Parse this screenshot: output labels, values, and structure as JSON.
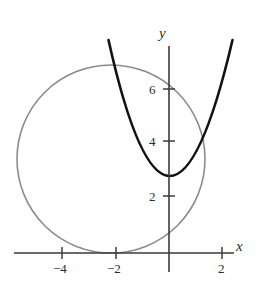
{
  "figure": {
    "title": "",
    "background_color": "#ffffff"
  },
  "axes": {
    "x_axis_label": "x",
    "y_axis_label": "y",
    "axis_color": "#3a3a3a",
    "origin_px": {
      "x": 169,
      "y": 253
    },
    "unit_px": {
      "x": 26.7,
      "y": 26.7
    },
    "x_ticks": [
      {
        "value": -4,
        "label": "−4",
        "px_x": 62
      },
      {
        "value": -2,
        "label": "−2",
        "px_x": 116
      },
      {
        "value": 2,
        "label": "2",
        "px_x": 222
      }
    ],
    "y_ticks": [
      {
        "value": 2,
        "label": "2",
        "px_y": 196
      },
      {
        "value": 4,
        "label": "4",
        "px_y": 141
      },
      {
        "value": 6,
        "label": "6",
        "px_y": 89
      }
    ],
    "x_range": [
      -5.3,
      3.2
    ],
    "y_range": [
      -1.4,
      8.6
    ],
    "grid": false,
    "legend": null
  },
  "chart_data": {
    "type": "line",
    "title": "",
    "xlabel": "x",
    "ylabel": "y",
    "xlim": [
      -5.3,
      3.2
    ],
    "ylim": [
      -1.4,
      8.6
    ],
    "grid": false,
    "legend_position": "none",
    "series": [
      {
        "name": "parabola",
        "kind": "parabola",
        "color": "#111111",
        "line_width": 2.6,
        "equation": "y = 1.25x^2 + 1",
        "vertex": [
          0,
          1
        ],
        "x": [
          -1.9,
          -1.7,
          -1.5,
          -1.3,
          -1.1,
          -0.9,
          -0.7,
          -0.5,
          -0.3,
          -0.1,
          0.1,
          0.3,
          0.5,
          0.7,
          0.9,
          1.1,
          1.3,
          1.5,
          1.7,
          1.9,
          2.1,
          2.2
        ],
        "values": [
          5.51,
          4.61,
          3.81,
          3.11,
          2.51,
          2.01,
          1.61,
          1.31,
          1.11,
          1.01,
          1.01,
          1.11,
          1.31,
          1.61,
          2.01,
          2.51,
          3.11,
          3.81,
          4.61,
          5.51,
          6.51,
          7.05
        ]
      },
      {
        "name": "circle",
        "kind": "circle",
        "color": "#8c8c8c",
        "line_width": 1.6,
        "equation": "(x + 2.2)^2 + (y - 3.5)^2 = 3.5^2",
        "center": [
          -2.2,
          3.5
        ],
        "radius": 3.5
      }
    ],
    "annotations": [
      {
        "text": "x",
        "type": "axis-label",
        "px_x": 238,
        "px_y": 246
      },
      {
        "text": "y",
        "type": "axis-label",
        "px_x": 162,
        "px_y": 30
      }
    ]
  }
}
